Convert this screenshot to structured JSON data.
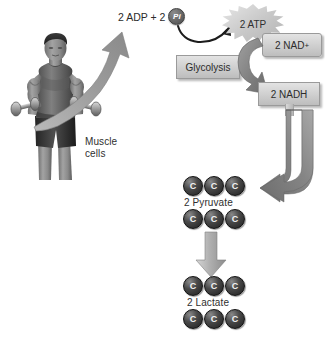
{
  "diagram": {
    "background": "#ffffff"
  },
  "labels": {
    "adp_text": "2 ADP  +  2",
    "pi_symbol": "Pi",
    "atp": "2 ATP",
    "glycolysis": "Glycolysis",
    "nad_plus": "2 NAD",
    "nad_plus_sup": "+",
    "nadh": "2 NADH",
    "muscle_line1": "Muscle",
    "muscle_line2": "cells",
    "pyruvate": "2 Pyruvate",
    "lactate": "2 Lactate",
    "carbon": "C"
  },
  "molecules": {
    "pyruvate": {
      "name": "2 Pyruvate",
      "rows": [
        [
          "C",
          "C",
          "C"
        ],
        [
          "C",
          "C",
          "C"
        ]
      ]
    },
    "lactate": {
      "name": "2 Lactate",
      "rows": [
        [
          "C",
          "C",
          "C"
        ],
        [
          "C",
          "C",
          "C"
        ]
      ]
    }
  },
  "arrows": {
    "muscle_to_adp": "large-curved-up-arrow",
    "adp_to_atp": "thin-curved-arrow",
    "nadplus_to_nadh": "thick-curved-arrow",
    "nadh_to_pyruvate": "j-shaped-arrow",
    "pyruvate_to_lactate": "straight-down-arrow"
  },
  "colors": {
    "box_fill": "#d2d2d2",
    "box_border": "#9a9a9a",
    "carbon_fill": "#2b2b2b",
    "arrow_gray": "#8d8d8d",
    "text": "#2f2f2f"
  }
}
